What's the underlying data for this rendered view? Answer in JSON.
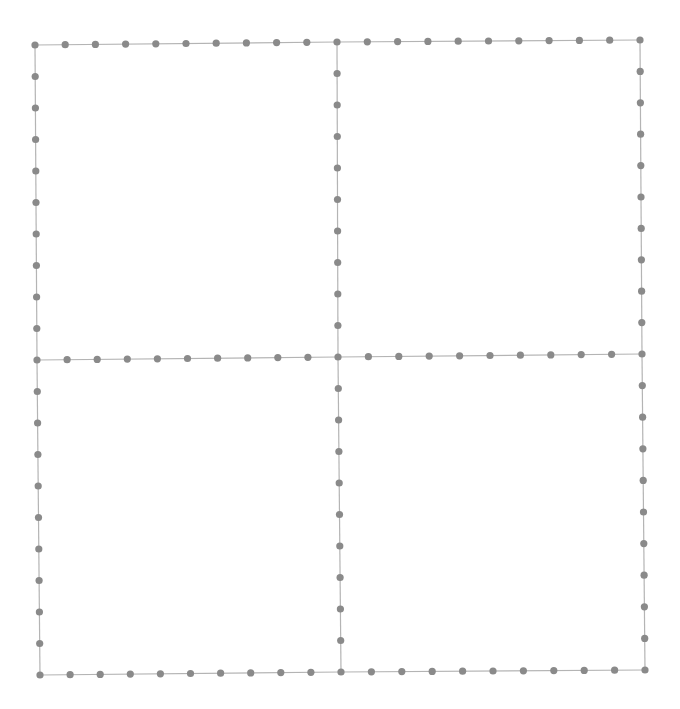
{
  "diagram": {
    "type": "quad-grid-dotted",
    "colors": {
      "background": "#ffffff",
      "line": "#b4b4b4",
      "dot": "#8a8a8a"
    },
    "segments_per_edge": 10,
    "dot_radius": 3.6,
    "nodes": {
      "top_left": [
        35,
        45
      ],
      "top_mid": [
        337,
        42
      ],
      "top_right": [
        640,
        40
      ],
      "mid_left": [
        37,
        360
      ],
      "center": [
        338,
        357
      ],
      "mid_right": [
        642,
        354
      ],
      "bottom_left": [
        40,
        675
      ],
      "bottom_mid": [
        341,
        672
      ],
      "bottom_right": [
        645,
        670
      ]
    },
    "edges": [
      [
        "top_left",
        "top_mid"
      ],
      [
        "top_mid",
        "top_right"
      ],
      [
        "mid_left",
        "center"
      ],
      [
        "center",
        "mid_right"
      ],
      [
        "bottom_left",
        "bottom_mid"
      ],
      [
        "bottom_mid",
        "bottom_right"
      ],
      [
        "top_left",
        "mid_left"
      ],
      [
        "mid_left",
        "bottom_left"
      ],
      [
        "top_mid",
        "center"
      ],
      [
        "center",
        "bottom_mid"
      ],
      [
        "top_right",
        "mid_right"
      ],
      [
        "mid_right",
        "bottom_right"
      ]
    ]
  }
}
